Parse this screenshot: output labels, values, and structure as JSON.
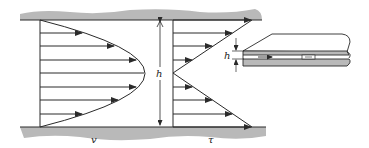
{
  "figure": {
    "labels": {
      "velocity": "v",
      "shear": "τ",
      "gap_main": "h",
      "gap_inset": "h"
    },
    "colors": {
      "plate_fill": "#b9b9b9",
      "line": "#2a2a2a",
      "background": "#ffffff"
    },
    "velocity_profile": {
      "shape": "parabolic",
      "arrow_count": 7
    },
    "shear_profile": {
      "shape": "linear, zero at centerline",
      "arrow_count": 8
    },
    "inset": {
      "description": "Two parallel plates in perspective with flow arrow between them"
    }
  }
}
